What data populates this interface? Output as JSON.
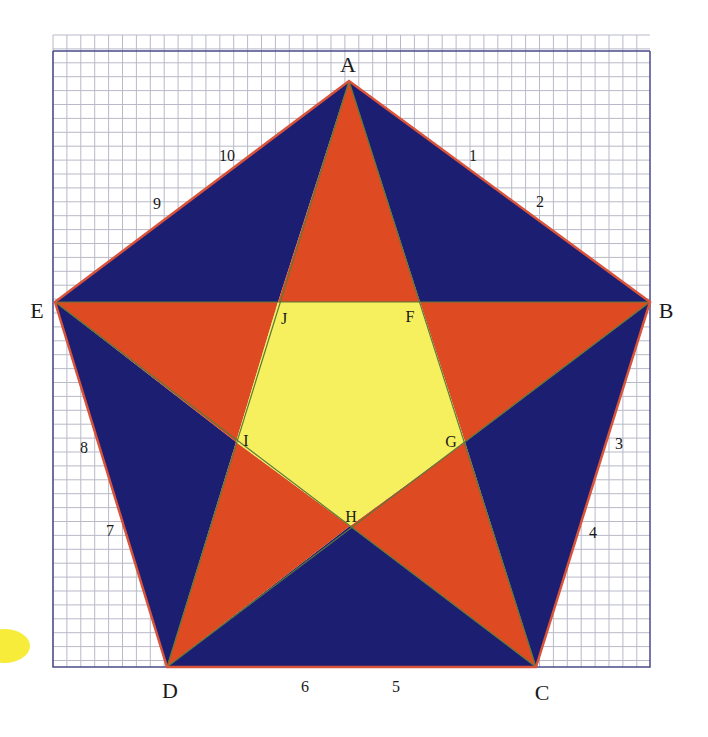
{
  "figure": {
    "colors": {
      "background": "#ffffff",
      "grid_line": "#b9b9c9",
      "grid_border": "#4a4a8a",
      "outer_triangles": "#1c1e72",
      "star_points": "#de4a22",
      "inner_pentagon": "#f6ef5e",
      "pentagon_edge": "#d9533a",
      "inner_edge": "#5a7a3a",
      "blob": "#f7ec3a"
    },
    "vertices": {
      "A": {
        "label": "A",
        "x": 349,
        "y": 81
      },
      "B": {
        "label": "B",
        "x": 650,
        "y": 302
      },
      "C": {
        "label": "C",
        "x": 536,
        "y": 667
      },
      "D": {
        "label": "D",
        "x": 167,
        "y": 667
      },
      "E": {
        "label": "E",
        "x": 55,
        "y": 302
      },
      "F": {
        "label": "F",
        "x": 420,
        "y": 302
      },
      "G": {
        "label": "G",
        "x": 465,
        "y": 442
      },
      "H": {
        "label": "H",
        "x": 350,
        "y": 526
      },
      "I": {
        "label": "I",
        "x": 236,
        "y": 442
      },
      "J": {
        "label": "J",
        "x": 278,
        "y": 302
      }
    },
    "vertex_labels": [
      {
        "id": "A",
        "text": "A",
        "x": 348,
        "y": 72
      },
      {
        "id": "B",
        "text": "B",
        "x": 666,
        "y": 318
      },
      {
        "id": "C",
        "text": "C",
        "x": 542,
        "y": 700
      },
      {
        "id": "D",
        "text": "D",
        "x": 170,
        "y": 698
      },
      {
        "id": "E",
        "text": "E",
        "x": 37,
        "y": 318
      },
      {
        "id": "F",
        "text": "F",
        "x": 410,
        "y": 322
      },
      {
        "id": "G",
        "text": "G",
        "x": 451,
        "y": 447
      },
      {
        "id": "H",
        "text": "H",
        "x": 351,
        "y": 522
      },
      {
        "id": "I",
        "text": "I",
        "x": 246,
        "y": 446
      },
      {
        "id": "J",
        "text": "J",
        "x": 284,
        "y": 324
      }
    ],
    "edge_numbers": [
      {
        "text": "1",
        "x": 473,
        "y": 161
      },
      {
        "text": "2",
        "x": 540,
        "y": 207
      },
      {
        "text": "3",
        "x": 619,
        "y": 449
      },
      {
        "text": "4",
        "x": 593,
        "y": 538
      },
      {
        "text": "5",
        "x": 396,
        "y": 692
      },
      {
        "text": "6",
        "x": 305,
        "y": 692
      },
      {
        "text": "7",
        "x": 110,
        "y": 536
      },
      {
        "text": "8",
        "x": 84,
        "y": 453
      },
      {
        "text": "9",
        "x": 157,
        "y": 209
      },
      {
        "text": "10",
        "x": 227,
        "y": 161
      }
    ],
    "grid": {
      "left": 53,
      "top": 35,
      "right": 650,
      "bottom": 667,
      "spacing": 13.9,
      "border_top": 51
    }
  }
}
